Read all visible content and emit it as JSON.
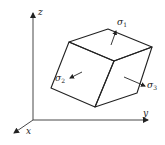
{
  "diagram": {
    "type": "principal-stress-element",
    "axes": {
      "x": {
        "label": "x"
      },
      "y": {
        "label": "y"
      },
      "z": {
        "label": "z"
      }
    },
    "stresses": [
      {
        "symbol": "σ",
        "index": "1",
        "direction": "outward-normal-top-face"
      },
      {
        "symbol": "σ",
        "index": "2",
        "direction": "inward-normal-left-face"
      },
      {
        "symbol": "σ",
        "index": "3",
        "direction": "outward-normal-right-face"
      }
    ],
    "colors": {
      "line": "#222222",
      "background": "#ffffff"
    }
  }
}
